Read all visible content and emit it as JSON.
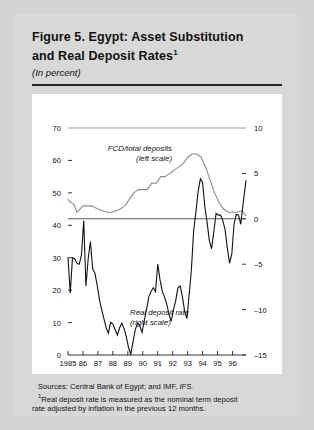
{
  "figure": {
    "title_line1": "Figure 5.  Egypt: Asset Substitution",
    "title_line2": "and Real Deposit Rates",
    "title_footnote_marker": "1",
    "subtitle": "(In percent)"
  },
  "notes": {
    "sources_prefix": "Sources: Central Bank of Egypt; and IMF, ",
    "sources_italic": "IFS.",
    "footnote_marker": "1",
    "footnote_line1": "Real deposit rate is measured as the nominal term deposit",
    "footnote_line2": "rate adjusted by inflation in the previous 12 months."
  },
  "chart_data": {
    "type": "line",
    "title": "Figure 5.  Egypt: Asset Substitution and Real Deposit Rates",
    "subtitle": "(In percent)",
    "xlabel": "",
    "ylabel": "",
    "grid": false,
    "legend": "inline-annotations",
    "x_tick_labels": [
      "1985",
      "86",
      "87",
      "88",
      "89",
      "90",
      "91",
      "92",
      "93",
      "94",
      "95",
      "96"
    ],
    "x_tick_values": [
      1985,
      1986,
      1987,
      1988,
      1989,
      1990,
      1991,
      1992,
      1993,
      1994,
      1995,
      1996
    ],
    "xlim": [
      1985,
      1996.9
    ],
    "left_axis": {
      "label": "FCD/total deposits (left scale)",
      "ylim": [
        0,
        70
      ],
      "ticks": [
        0,
        10,
        20,
        30,
        40,
        50,
        60,
        70
      ],
      "tick_labels": [
        "0",
        "10",
        "20",
        "30",
        "40",
        "50",
        "60",
        "70"
      ]
    },
    "right_axis": {
      "label": "Real deposit rate (right scale)",
      "ylim": [
        -15,
        10
      ],
      "ticks": [
        -15,
        -10,
        -5,
        0,
        5,
        10
      ],
      "tick_labels": [
        "-15",
        "-10",
        "-5",
        "0",
        "5",
        "10"
      ]
    },
    "zero_line_right_value": 0,
    "series": [
      {
        "name": "FCD/total deposits",
        "annotation_line1": "FCD/total deposits",
        "annotation_line2": "(left scale)",
        "axis": "left",
        "color": "#8c8c8c",
        "x": [
          1985.0,
          1985.2,
          1985.4,
          1985.6,
          1985.8,
          1986.0,
          1986.2,
          1986.4,
          1986.6,
          1986.8,
          1987.0,
          1987.3,
          1987.6,
          1987.9,
          1988.2,
          1988.5,
          1988.8,
          1989.1,
          1989.4,
          1989.7,
          1990.0,
          1990.3,
          1990.6,
          1990.9,
          1991.2,
          1991.5,
          1991.8,
          1992.1,
          1992.4,
          1992.7,
          1993.0,
          1993.3,
          1993.6,
          1993.9,
          1994.2,
          1994.5,
          1994.8,
          1995.1,
          1995.4,
          1995.7,
          1996.0,
          1996.3,
          1996.6,
          1996.9
        ],
        "values": [
          48,
          47,
          46.5,
          44,
          45,
          46,
          46,
          46,
          46,
          45.5,
          45,
          44.5,
          44,
          44,
          44.5,
          45,
          46,
          48,
          50,
          51,
          51,
          51,
          53,
          53,
          55,
          55,
          56,
          57,
          58,
          59,
          61,
          62,
          62,
          61,
          58,
          54,
          50,
          47,
          45,
          44,
          44,
          44,
          44.5,
          43
        ],
        "values_note": "FCD as percent of total deposits; rises from ~46 in 1986 to a peak near 62 in 1993, then declines to ~44 by 1996"
      },
      {
        "name": "Real deposit rate",
        "annotation_line1": "Real deposit rate",
        "annotation_line2": "(right scale)",
        "axis": "right",
        "color": "#111111",
        "x": [
          1985.0,
          1985.15,
          1985.3,
          1985.45,
          1985.6,
          1985.75,
          1985.9,
          1986.05,
          1986.2,
          1986.35,
          1986.5,
          1986.65,
          1986.8,
          1986.95,
          1987.1,
          1987.25,
          1987.4,
          1987.55,
          1987.7,
          1987.85,
          1988.0,
          1988.15,
          1988.3,
          1988.45,
          1988.6,
          1988.75,
          1988.9,
          1989.05,
          1989.2,
          1989.35,
          1989.5,
          1989.65,
          1989.8,
          1989.95,
          1990.1,
          1990.25,
          1990.4,
          1990.55,
          1990.7,
          1990.85,
          1991.0,
          1991.15,
          1991.3,
          1991.45,
          1991.6,
          1991.75,
          1991.9,
          1992.05,
          1992.2,
          1992.35,
          1992.5,
          1992.65,
          1992.8,
          1992.95,
          1993.1,
          1993.25,
          1993.4,
          1993.55,
          1993.7,
          1993.85,
          1994.0,
          1994.15,
          1994.3,
          1994.45,
          1994.6,
          1994.75,
          1994.9,
          1995.05,
          1995.2,
          1995.35,
          1995.5,
          1995.65,
          1995.8,
          1995.95,
          1996.1,
          1996.25,
          1996.4,
          1996.55,
          1996.7,
          1996.9
        ],
        "values": [
          -4.3,
          -8.2,
          -4.3,
          -4.4,
          -4.9,
          -5.0,
          -4.0,
          -0.2,
          -7.4,
          -4.4,
          -2.5,
          -5.5,
          -6.0,
          -7.3,
          -8.9,
          -10.0,
          -11.0,
          -12.0,
          -12.6,
          -11.4,
          -11.6,
          -12.2,
          -12.8,
          -12.0,
          -11.5,
          -12.1,
          -13.0,
          -14.2,
          -14.9,
          -13.5,
          -12.2,
          -11.5,
          -11.8,
          -12.5,
          -11.2,
          -10.0,
          -8.6,
          -8.0,
          -7.6,
          -8.0,
          -5.0,
          -6.7,
          -8.0,
          -8.6,
          -9.4,
          -10.5,
          -11.3,
          -10.0,
          -9.0,
          -7.6,
          -7.4,
          -8.6,
          -10.2,
          -11.0,
          -8.4,
          -5.6,
          -1.3,
          0.7,
          3.0,
          4.4,
          4.0,
          1.3,
          -0.4,
          -2.4,
          -3.3,
          -1.4,
          0.6,
          0.4,
          0.4,
          -0.2,
          -1.2,
          -3.2,
          -4.9,
          -3.9,
          -0.6,
          0.5,
          0.4,
          -0.6,
          1.6,
          4.2
        ],
        "values_note": "Real deposit rate in percent; mostly negative 1985-1992, turning positive 1993-1996"
      }
    ]
  }
}
